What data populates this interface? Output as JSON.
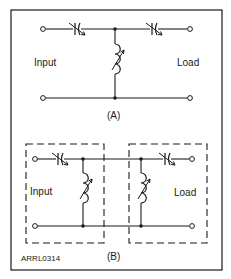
{
  "figure": {
    "credit": "ARRL0314",
    "colors": {
      "line": "#1a1a1a",
      "background": "#ffffff"
    }
  },
  "part_a": {
    "caption": "(A)",
    "input_label": "Input",
    "load_label": "Load",
    "components": [
      "variable-capacitor-series-input",
      "variable-capacitor-series-output",
      "variable-inductor-shunt"
    ]
  },
  "part_b": {
    "caption": "(B)",
    "input_label": "Input",
    "load_label": "Load",
    "components": [
      "variable-capacitor-series-input",
      "variable-inductor-shunt-input",
      "variable-inductor-shunt-output",
      "variable-capacitor-series-output"
    ]
  }
}
